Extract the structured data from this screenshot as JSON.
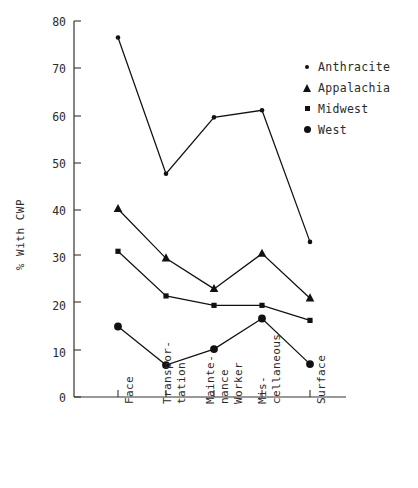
{
  "chart_data": {
    "type": "line",
    "title": "",
    "xlabel": "",
    "ylabel": "% With CWP",
    "ylim": [
      0,
      80
    ],
    "yticks": [
      0,
      10,
      20,
      30,
      40,
      50,
      60,
      70,
      80
    ],
    "ytick_labels": [
      "0",
      "10",
      "20",
      "30",
      "40",
      "50",
      "60",
      "70",
      "80"
    ],
    "grid": false,
    "legend_position": "right-top",
    "categories": [
      "Face",
      "Transportation",
      "Maintenance Worker",
      "Miscellaneous",
      "Surface"
    ],
    "category_label_lines": [
      [
        "Face"
      ],
      [
        "Transpor-",
        "tation"
      ],
      [
        "Mainte-",
        "nance",
        "Worker"
      ],
      [
        "Mis-",
        "cellaneous"
      ],
      [
        "Surface"
      ]
    ],
    "series": [
      {
        "name": "Anthracite",
        "marker": "small-circle",
        "values": [
          76.5,
          47.5,
          59.5,
          61.0,
          33.0
        ]
      },
      {
        "name": "Appalachia",
        "marker": "triangle",
        "values": [
          40.0,
          29.5,
          23.0,
          30.5,
          21.0
        ]
      },
      {
        "name": "Midwest",
        "marker": "square",
        "values": [
          31.0,
          21.5,
          19.5,
          19.5,
          16.3
        ]
      },
      {
        "name": "West",
        "marker": "large-circle",
        "values": [
          15.0,
          6.8,
          10.2,
          16.7,
          7.0
        ]
      }
    ]
  },
  "legend": {
    "items": [
      {
        "label": "Anthracite",
        "marker": "small-circle-icon"
      },
      {
        "label": "Appalachia",
        "marker": "triangle-icon"
      },
      {
        "label": "Midwest",
        "marker": "square-icon"
      },
      {
        "label": "West",
        "marker": "large-circle-icon"
      }
    ]
  },
  "axis": {
    "y_title": "% With CWP",
    "y_labels": [
      "80",
      "70",
      "60",
      "50",
      "40",
      "30",
      "20",
      "10",
      "0"
    ]
  },
  "colors": {
    "line": "#111111",
    "marker": "#111111",
    "axis": "#333333",
    "text": "#2b2b2b",
    "background": "#ffffff"
  }
}
